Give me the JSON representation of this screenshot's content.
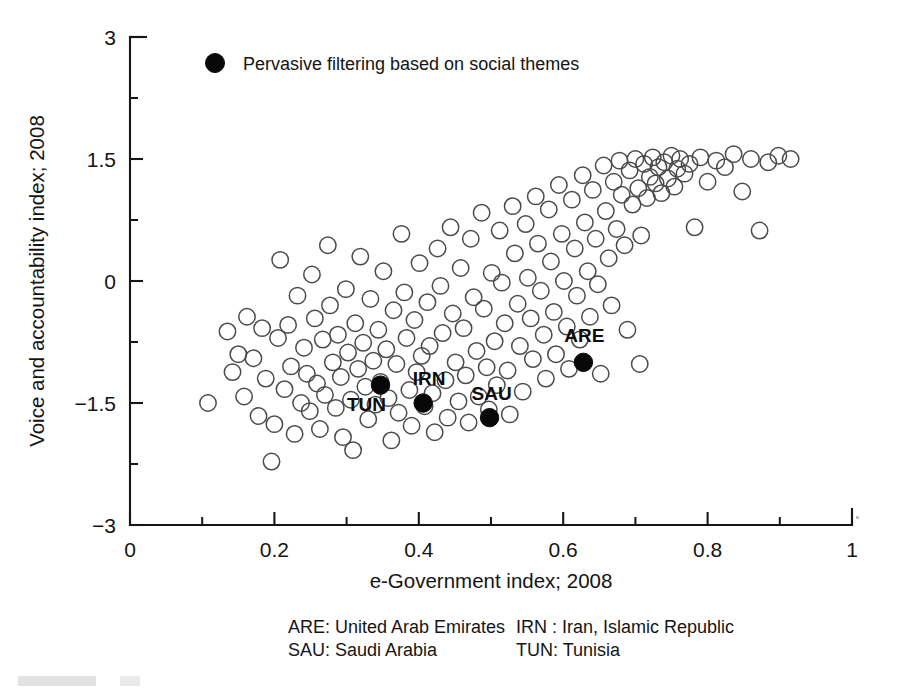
{
  "figure": {
    "background_color": "#ffffff",
    "ink_color": "#141414",
    "open_marker_color": "#4b4b4b",
    "solid_marker_color": "#080808"
  },
  "legend": {
    "marker": "filled-circle",
    "label": "Pervasive filtering based on social themes"
  },
  "footnote": {
    "rows": [
      {
        "left": "ARE: United Arab Emirates",
        "right": "IRN : Iran, Islamic Republic"
      },
      {
        "left": "SAU: Saudi Arabia",
        "right": "TUN: Tunisia"
      }
    ]
  },
  "chart_data": {
    "type": "scatter",
    "title": "",
    "xlabel": "e-Government index; 2008",
    "ylabel": "Voice and accountability index; 2008",
    "xlim": [
      0,
      1
    ],
    "ylim": [
      -3,
      3
    ],
    "xticks": [
      0,
      0.2,
      0.4,
      0.6,
      0.8,
      1
    ],
    "xtick_labels": [
      "0",
      "0.2",
      "0.4",
      "0.6",
      "0.8",
      "1"
    ],
    "xminor_ticks": [
      0.1,
      0.3,
      0.5,
      0.7,
      0.9
    ],
    "yticks": [
      -3,
      -1.5,
      0,
      1.5,
      3
    ],
    "ytick_labels": [
      "−3",
      "−1.5",
      "0",
      "1.5",
      "3"
    ],
    "yminor_ticks": [
      -2.25,
      -0.75,
      0.75,
      2.25
    ],
    "grid": false,
    "legend_position": "top-left-inside",
    "series": [
      {
        "name": "Countries",
        "marker": "open-circle",
        "points": [
          [
            0.108,
            -1.5
          ],
          [
            0.135,
            -0.62
          ],
          [
            0.142,
            -1.12
          ],
          [
            0.15,
            -0.9
          ],
          [
            0.158,
            -1.42
          ],
          [
            0.162,
            -0.44
          ],
          [
            0.171,
            -0.95
          ],
          [
            0.178,
            -1.66
          ],
          [
            0.183,
            -0.58
          ],
          [
            0.188,
            -1.2
          ],
          [
            0.196,
            -2.22
          ],
          [
            0.2,
            -1.76
          ],
          [
            0.205,
            -0.7
          ],
          [
            0.208,
            0.26
          ],
          [
            0.214,
            -1.33
          ],
          [
            0.219,
            -0.54
          ],
          [
            0.223,
            -1.05
          ],
          [
            0.228,
            -1.88
          ],
          [
            0.232,
            -0.18
          ],
          [
            0.237,
            -1.5
          ],
          [
            0.241,
            -0.82
          ],
          [
            0.245,
            -1.14
          ],
          [
            0.249,
            -1.6
          ],
          [
            0.252,
            0.08
          ],
          [
            0.256,
            -0.46
          ],
          [
            0.259,
            -1.26
          ],
          [
            0.263,
            -1.82
          ],
          [
            0.267,
            -0.72
          ],
          [
            0.27,
            -1.4
          ],
          [
            0.274,
            0.44
          ],
          [
            0.277,
            -0.3
          ],
          [
            0.281,
            -1.0
          ],
          [
            0.285,
            -1.56
          ],
          [
            0.288,
            -0.66
          ],
          [
            0.292,
            -1.18
          ],
          [
            0.295,
            -1.92
          ],
          [
            0.299,
            -0.1
          ],
          [
            0.302,
            -0.88
          ],
          [
            0.306,
            -1.46
          ],
          [
            0.309,
            -2.08
          ],
          [
            0.312,
            -0.52
          ],
          [
            0.316,
            -1.08
          ],
          [
            0.319,
            0.3
          ],
          [
            0.323,
            -0.76
          ],
          [
            0.326,
            -1.3
          ],
          [
            0.33,
            -1.7
          ],
          [
            0.333,
            -0.22
          ],
          [
            0.337,
            -0.98
          ],
          [
            0.34,
            -1.52
          ],
          [
            0.344,
            -0.6
          ],
          [
            0.347,
            -1.24
          ],
          [
            0.351,
            0.12
          ],
          [
            0.355,
            -0.84
          ],
          [
            0.358,
            -1.44
          ],
          [
            0.362,
            -1.96
          ],
          [
            0.365,
            -0.36
          ],
          [
            0.369,
            -1.02
          ],
          [
            0.372,
            -1.62
          ],
          [
            0.376,
            0.58
          ],
          [
            0.38,
            -0.14
          ],
          [
            0.383,
            -0.7
          ],
          [
            0.387,
            -1.34
          ],
          [
            0.39,
            -1.78
          ],
          [
            0.394,
            -0.48
          ],
          [
            0.397,
            -1.12
          ],
          [
            0.401,
            0.22
          ],
          [
            0.404,
            -0.92
          ],
          [
            0.408,
            -1.54
          ],
          [
            0.412,
            -0.26
          ],
          [
            0.415,
            -0.8
          ],
          [
            0.419,
            -1.38
          ],
          [
            0.422,
            -1.86
          ],
          [
            0.426,
            0.4
          ],
          [
            0.43,
            -0.06
          ],
          [
            0.433,
            -0.64
          ],
          [
            0.437,
            -1.22
          ],
          [
            0.44,
            -1.68
          ],
          [
            0.444,
            0.66
          ],
          [
            0.447,
            -0.4
          ],
          [
            0.451,
            -1.0
          ],
          [
            0.455,
            -1.48
          ],
          [
            0.458,
            0.16
          ],
          [
            0.462,
            -0.58
          ],
          [
            0.465,
            -1.16
          ],
          [
            0.469,
            -1.74
          ],
          [
            0.472,
            0.52
          ],
          [
            0.476,
            -0.2
          ],
          [
            0.48,
            -0.86
          ],
          [
            0.483,
            -1.42
          ],
          [
            0.487,
            0.84
          ],
          [
            0.49,
            -0.34
          ],
          [
            0.494,
            -1.06
          ],
          [
            0.497,
            -1.58
          ],
          [
            0.501,
            0.1
          ],
          [
            0.505,
            -0.74
          ],
          [
            0.508,
            -1.28
          ],
          [
            0.512,
            0.62
          ],
          [
            0.515,
            -0.02
          ],
          [
            0.519,
            -0.52
          ],
          [
            0.523,
            -1.1
          ],
          [
            0.526,
            -1.64
          ],
          [
            0.53,
            0.92
          ],
          [
            0.533,
            0.34
          ],
          [
            0.537,
            -0.28
          ],
          [
            0.54,
            -0.8
          ],
          [
            0.544,
            -1.36
          ],
          [
            0.548,
            0.7
          ],
          [
            0.551,
            0.04
          ],
          [
            0.555,
            -0.46
          ],
          [
            0.558,
            -0.96
          ],
          [
            0.562,
            1.04
          ],
          [
            0.565,
            0.46
          ],
          [
            0.569,
            -0.12
          ],
          [
            0.573,
            -0.66
          ],
          [
            0.576,
            -1.2
          ],
          [
            0.58,
            0.88
          ],
          [
            0.583,
            0.24
          ],
          [
            0.587,
            -0.38
          ],
          [
            0.59,
            -0.9
          ],
          [
            0.594,
            1.18
          ],
          [
            0.598,
            0.58
          ],
          [
            0.601,
            0.0
          ],
          [
            0.605,
            -0.56
          ],
          [
            0.608,
            -1.08
          ],
          [
            0.612,
            1.0
          ],
          [
            0.616,
            0.4
          ],
          [
            0.619,
            -0.18
          ],
          [
            0.623,
            -0.72
          ],
          [
            0.627,
            1.3
          ],
          [
            0.63,
            0.72
          ],
          [
            0.634,
            0.12
          ],
          [
            0.637,
            -0.44
          ],
          [
            0.641,
            1.12
          ],
          [
            0.645,
            0.52
          ],
          [
            0.648,
            -0.04
          ],
          [
            0.652,
            -1.14
          ],
          [
            0.656,
            1.42
          ],
          [
            0.659,
            0.86
          ],
          [
            0.663,
            0.28
          ],
          [
            0.667,
            -0.3
          ],
          [
            0.67,
            1.22
          ],
          [
            0.674,
            0.64
          ],
          [
            0.678,
            1.48
          ],
          [
            0.681,
            1.06
          ],
          [
            0.685,
            0.44
          ],
          [
            0.689,
            -0.6
          ],
          [
            0.692,
            1.36
          ],
          [
            0.696,
            0.94
          ],
          [
            0.7,
            1.5
          ],
          [
            0.704,
            1.14
          ],
          [
            0.708,
            0.56
          ],
          [
            0.712,
            1.44
          ],
          [
            0.716,
            1.02
          ],
          [
            0.72,
            1.28
          ],
          [
            0.724,
            1.52
          ],
          [
            0.728,
            1.2
          ],
          [
            0.732,
            1.4
          ],
          [
            0.736,
            1.08
          ],
          [
            0.74,
            1.46
          ],
          [
            0.745,
            1.26
          ],
          [
            0.75,
            1.54
          ],
          [
            0.754,
            1.16
          ],
          [
            0.758,
            1.38
          ],
          [
            0.762,
            1.5
          ],
          [
            0.768,
            1.32
          ],
          [
            0.775,
            1.44
          ],
          [
            0.782,
            0.66
          ],
          [
            0.79,
            1.52
          ],
          [
            0.8,
            1.22
          ],
          [
            0.812,
            1.48
          ],
          [
            0.824,
            1.4
          ],
          [
            0.836,
            1.56
          ],
          [
            0.848,
            1.1
          ],
          [
            0.86,
            1.5
          ],
          [
            0.872,
            0.62
          ],
          [
            0.884,
            1.46
          ],
          [
            0.898,
            1.54
          ],
          [
            0.915,
            1.5
          ],
          [
            0.706,
            -1.02
          ]
        ]
      },
      {
        "name": "Pervasive filtering based on social themes",
        "marker": "filled-circle",
        "points": [
          {
            "label": "TUN",
            "x": 0.347,
            "y": -1.28,
            "label_dx": -14,
            "label_dy": 26
          },
          {
            "label": "IRN",
            "x": 0.406,
            "y": -1.5,
            "label_dx": 6,
            "label_dy": -18
          },
          {
            "label": "SAU",
            "x": 0.498,
            "y": -1.68,
            "label_dx": 2,
            "label_dy": -18
          },
          {
            "label": "ARE",
            "x": 0.628,
            "y": -1.0,
            "label_dx": 1,
            "label_dy": -20
          }
        ]
      }
    ]
  }
}
